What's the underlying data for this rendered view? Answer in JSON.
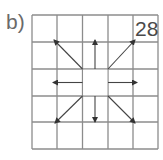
{
  "figure": {
    "label": "b)",
    "number": "28"
  },
  "grid": {
    "rows": 5,
    "cols": 5,
    "x": [
      32,
      57,
      82.5,
      108,
      133,
      158
    ],
    "y": [
      15,
      42,
      69,
      96,
      122,
      149
    ],
    "line_color": "#8c8c8c",
    "arrow_color": "#444444",
    "center_cell": {
      "row": 2,
      "col": 2,
      "empty": true
    }
  },
  "arrows": [
    {
      "name": "arrow-up",
      "from": [
        95,
        69
      ],
      "to": [
        95,
        40
      ]
    },
    {
      "name": "arrow-down",
      "from": [
        95,
        96
      ],
      "to": [
        95,
        122
      ]
    },
    {
      "name": "arrow-left",
      "from": [
        82.5,
        82.5
      ],
      "to": [
        53,
        82.5
      ]
    },
    {
      "name": "arrow-right",
      "from": [
        108,
        82.5
      ],
      "to": [
        137,
        82.5
      ]
    },
    {
      "name": "arrow-up-left",
      "from": [
        82.5,
        69
      ],
      "to": [
        54,
        40
      ]
    },
    {
      "name": "arrow-up-right",
      "from": [
        108,
        69
      ],
      "to": [
        135,
        40
      ]
    },
    {
      "name": "arrow-down-left",
      "from": [
        82.5,
        96
      ],
      "to": [
        55,
        123
      ]
    },
    {
      "name": "arrow-down-right",
      "from": [
        108,
        96
      ],
      "to": [
        135,
        123
      ]
    }
  ]
}
